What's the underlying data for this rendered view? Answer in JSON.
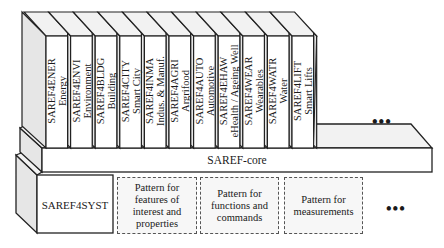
{
  "diagram": {
    "type": "layered-ontology-stack",
    "extensions": [
      {
        "code": "SAREF4ENER",
        "name": "Energy"
      },
      {
        "code": "SAREF4ENVI",
        "name": "Environment"
      },
      {
        "code": "SAREF4BLDG",
        "name": "Building"
      },
      {
        "code": "SAREF4CITY",
        "name": "Smart City"
      },
      {
        "code": "SAREF4INMA",
        "name": "Indus. & Manuf."
      },
      {
        "code": "SAREF4AGRI",
        "name": "Argrifood"
      },
      {
        "code": "SAREF4AUTO",
        "name": "Automotive"
      },
      {
        "code": "SAREF4EHAW",
        "name": "eHealth / Ageing Well"
      },
      {
        "code": "SAREF4WEAR",
        "name": "Wearables"
      },
      {
        "code": "SAREF4WATR",
        "name": "Water"
      },
      {
        "code": "SAREF4LIFT",
        "name": "Smart Lifts"
      }
    ],
    "more_extensions": "•••",
    "core": {
      "label": "SAREF-core"
    },
    "foundation": {
      "label": "SAREF4SYST"
    },
    "patterns": [
      {
        "label": "Pattern for features of interest and properties"
      },
      {
        "label": "Pattern for functions and commands"
      },
      {
        "label": "Pattern for measurements"
      }
    ],
    "more_patterns": "•••",
    "colors": {
      "front_face": "#ffffff",
      "side_face": "#e6e6e6",
      "top_face": "#f2f2f2",
      "stroke": "#222222",
      "dashed_border": "#555555"
    }
  }
}
